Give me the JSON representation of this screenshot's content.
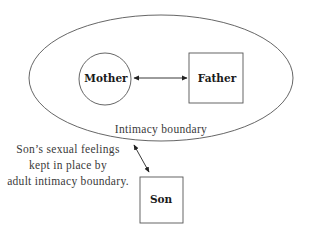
{
  "diagram": {
    "boundary": {
      "label": "Intimacy boundary",
      "shape": "ellipse"
    },
    "nodes": {
      "mother": {
        "label": "Mother",
        "shape": "circle"
      },
      "father": {
        "label": "Father",
        "shape": "square"
      },
      "son": {
        "label": "Son",
        "shape": "square"
      }
    },
    "edges": [
      {
        "from": "Mother",
        "to": "Father",
        "type": "bidirectional-arrow"
      },
      {
        "from": "Intimacy boundary",
        "to": "Son",
        "type": "bidirectional-arrow"
      }
    ],
    "caption": {
      "lines": [
        "Son’s sexual feelings",
        "kept in place by",
        "adult intimacy boundary."
      ]
    },
    "colors": {
      "stroke": "#555555",
      "text": "#1a1a1a",
      "background": "#ffffff"
    }
  }
}
